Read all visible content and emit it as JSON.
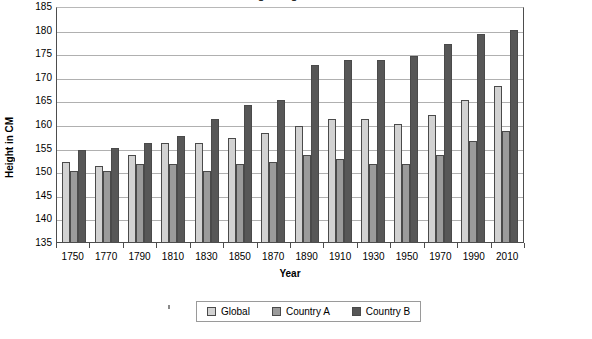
{
  "chart_data": {
    "type": "bar",
    "title": "Average Height Over Time",
    "xlabel": "Year",
    "ylabel": "Height in CM",
    "categories": [
      "1750",
      "1770",
      "1790",
      "1810",
      "1830",
      "1850",
      "1870",
      "1890",
      "1910",
      "1930",
      "1950",
      "1970",
      "1990",
      "2010"
    ],
    "ylim": [
      135,
      185
    ],
    "ytick_step": 5,
    "yticks": [
      185,
      180,
      175,
      170,
      165,
      160,
      155,
      150,
      145,
      140,
      135
    ],
    "grid": true,
    "legend_position": "bottom",
    "series": [
      {
        "name": "Global",
        "color": "#d2d2d2",
        "values": [
          152,
          151,
          153.5,
          156,
          156,
          157,
          158,
          159.5,
          161,
          161,
          160,
          162,
          165,
          168
        ]
      },
      {
        "name": "Country A",
        "color": "#9b9b9b",
        "values": [
          150,
          150,
          151.5,
          151.5,
          150,
          151.5,
          152,
          153.5,
          152.5,
          151.5,
          151.5,
          153.5,
          156.5,
          158.5
        ]
      },
      {
        "name": "Country B",
        "color": "#575757",
        "values": [
          154.5,
          155,
          156,
          157.5,
          161,
          164,
          165,
          172.5,
          173.5,
          173.5,
          174.5,
          177,
          179,
          180
        ]
      }
    ]
  },
  "axis": {
    "y_title": "Height in CM",
    "x_title": "Year"
  },
  "legend": {
    "items": [
      {
        "label": "Global"
      },
      {
        "label": "Country A"
      },
      {
        "label": "Country B"
      }
    ]
  }
}
